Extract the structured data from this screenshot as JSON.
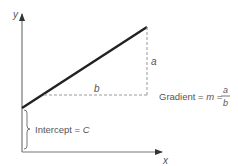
{
  "diagram": {
    "axes": {
      "x_label": "x",
      "y_label": "y"
    },
    "labels": {
      "rise": "a",
      "run": "b",
      "gradient_prefix": "Gradient = ",
      "gradient_symbol": "m",
      "equals": " = ",
      "fraction_numerator": "a",
      "fraction_denominator": "b",
      "intercept_prefix": "Intercept = ",
      "intercept_symbol": "C"
    },
    "colors": {
      "line": "#222222",
      "axis": "#777777",
      "dashed": "#999999",
      "text": "#555555"
    }
  }
}
